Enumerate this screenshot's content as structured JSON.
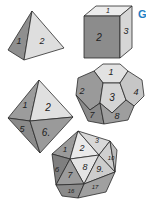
{
  "figure": {
    "side_label": "G",
    "side_label_color": "#1f7fc4",
    "dice": [
      {
        "name": "tetrahedron",
        "faces": [
          "1",
          "2"
        ]
      },
      {
        "name": "cube",
        "faces": [
          "1",
          "2",
          "3"
        ]
      },
      {
        "name": "octahedron",
        "faces": [
          "1",
          "2",
          "5",
          "6."
        ]
      },
      {
        "name": "dodecahedron",
        "faces": [
          "1",
          "2",
          "3",
          "4",
          "7",
          "8"
        ]
      },
      {
        "name": "icosahedron",
        "faces": [
          "1",
          "2",
          "3",
          "6",
          "7",
          "8",
          "9.",
          "10",
          "16",
          "17"
        ]
      }
    ],
    "colors": {
      "light": "#e6e6e6",
      "mid": "#b4b4b4",
      "dark": "#8a8a8a",
      "darker": "#777777"
    }
  }
}
